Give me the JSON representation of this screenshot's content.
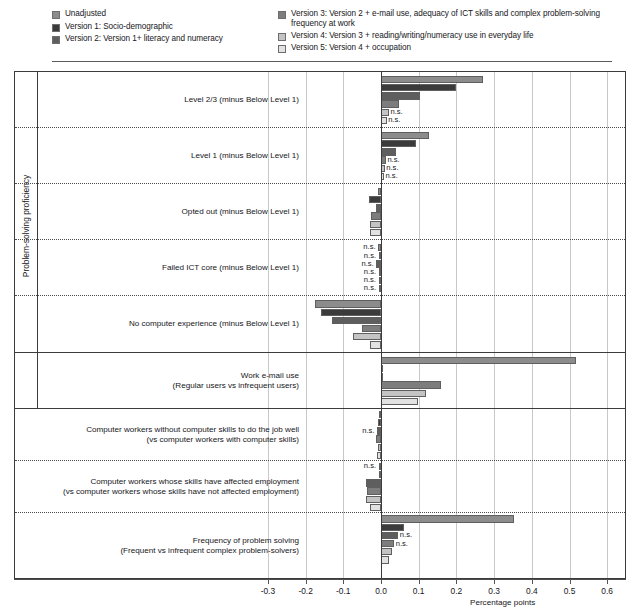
{
  "legend": {
    "columns": [
      {
        "id": "legend-col-left",
        "items": [
          {
            "label": "Unadjusted",
            "color": "#8c8c8c"
          },
          {
            "label": "Version 1: Socio-demographic",
            "color": "#3b3b3b"
          },
          {
            "label": "Version 2: Version 1+ literacy and numeracy",
            "color": "#5e5e5e"
          }
        ]
      },
      {
        "id": "legend-col-right",
        "items": [
          {
            "label": "Version 3: Version 2 + e-mail use, adequacy of ICT skills and complex problem-solving frequency at work",
            "color": "#7d7d7d"
          },
          {
            "label": "Version 4: Version 3 + reading/writing/numeracy use in everyday life",
            "color": "#c4c4c4"
          },
          {
            "label": "Version 5: Version 4 + occupation",
            "color": "#e2e2e2"
          }
        ]
      }
    ]
  },
  "axis": {
    "y_group_label": "Problem-solving proficiency",
    "x_title": "Percentage points",
    "x_ticks": [
      "-0.3",
      "-0.2",
      "-0.1",
      "0.0",
      "0.1",
      "0.2",
      "0.3",
      "0.4",
      "0.5",
      "0.6"
    ],
    "x_tick_values": [
      -0.3,
      -0.2,
      -0.1,
      0.0,
      0.1,
      0.2,
      0.3,
      0.4,
      0.5,
      0.6
    ],
    "xlim": [
      -0.35,
      0.64
    ]
  },
  "chart_data": {
    "type": "bar",
    "orientation": "horizontal",
    "title": "",
    "xlabel": "Percentage points",
    "ylabel": "Problem-solving proficiency",
    "xlim": [
      -0.35,
      0.64
    ],
    "grid": "vertical gridlines at each 0.1 tick; dotted horizontal separators between category groups",
    "legend_position": "top",
    "series": [
      {
        "name": "Unadjusted",
        "color": "#8c8c8c"
      },
      {
        "name": "Version 1: Socio-demographic",
        "color": "#3b3b3b"
      },
      {
        "name": "Version 2: Version 1+ literacy and numeracy",
        "color": "#5e5e5e"
      },
      {
        "name": "Version 3: Version 2 + e-mail use, adequacy of ICT skills and complex problem-solving frequency at work",
        "color": "#7d7d7d"
      },
      {
        "name": "Version 4: Version 3 + reading/writing/numeracy use in everyday life",
        "color": "#c4c4c4"
      },
      {
        "name": "Version 5: Version 4 + occupation",
        "color": "#e2e2e2"
      }
    ],
    "categories": [
      {
        "label": "Level 2/3  (minus Below Level 1)",
        "group": "Problem-solving proficiency",
        "values": [
          0.27,
          0.198,
          0.104,
          0.047,
          0.021,
          0.015
        ],
        "ns": [
          false,
          false,
          false,
          false,
          true,
          true
        ]
      },
      {
        "label": "Level 1  (minus Below Level 1)",
        "group": "Problem-solving proficiency",
        "values": [
          0.126,
          0.094,
          0.039,
          0.013,
          0.01,
          0.008
        ],
        "ns": [
          false,
          false,
          false,
          true,
          true,
          true
        ]
      },
      {
        "label": "Opted out  (minus Below Level 1)",
        "group": "Problem-solving proficiency",
        "values": [
          -0.008,
          -0.032,
          -0.013,
          -0.026,
          -0.029,
          -0.028
        ],
        "ns": [
          false,
          false,
          false,
          false,
          false,
          false
        ]
      },
      {
        "label": "Failed ICT core  (minus Below Level 1)",
        "group": "Problem-solving proficiency",
        "values": [
          -0.007,
          -0.005,
          -0.012,
          -0.004,
          -0.006,
          -0.005
        ],
        "ns": [
          true,
          true,
          true,
          true,
          true,
          true
        ]
      },
      {
        "label": "No computer experience (minus Below Level 1)",
        "group": "Problem-solving proficiency",
        "values": [
          -0.176,
          -0.158,
          -0.13,
          -0.05,
          -0.075,
          -0.03
        ],
        "ns": [
          false,
          false,
          false,
          false,
          false,
          false
        ]
      },
      {
        "label": "Work e-mail use\n(Regular users vs infrequent users)",
        "group": "",
        "values": [
          0.516,
          0.0,
          0.0,
          0.158,
          0.12,
          0.099
        ],
        "ns": [
          false,
          false,
          false,
          false,
          false,
          false
        ]
      },
      {
        "label": "Computer workers without computer skills to do the job well\n(vs computer workers with computer skills)",
        "group": "",
        "values": [
          -0.006,
          -0.009,
          -0.01,
          -0.012,
          -0.009,
          -0.01
        ],
        "ns": [
          false,
          false,
          true,
          false,
          false,
          false
        ]
      },
      {
        "label": "Computer workers whose skills have affected employment\n(vs computer workers whose skills have not affected employment)",
        "group": "",
        "values": [
          -0.004,
          -0.002,
          -0.041,
          -0.036,
          -0.04,
          -0.03
        ],
        "ns": [
          true,
          false,
          false,
          false,
          false,
          false
        ]
      },
      {
        "label": "Frequency of problem solving\n(Frequent vs infrequent complex problem-solvers)",
        "group": "",
        "values": [
          0.352,
          0.06,
          0.046,
          0.035,
          0.03,
          0.022
        ],
        "ns": [
          false,
          false,
          true,
          true,
          false,
          false
        ]
      }
    ],
    "ns_label": "n.s."
  }
}
